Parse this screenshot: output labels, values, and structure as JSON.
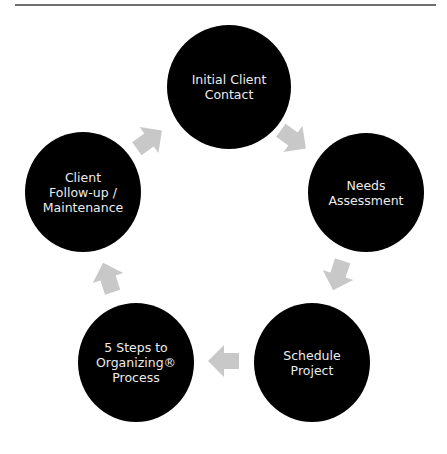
{
  "diagram": {
    "type": "cycle",
    "colors": {
      "node_fill": "#000000",
      "node_text": "#ececec",
      "arrow_fill": "#c8c8c8",
      "rule": "#6e6e6e"
    },
    "nodes": [
      {
        "label": "Initial Client\nContact"
      },
      {
        "label": "Needs\nAssessment"
      },
      {
        "label": "Schedule\nProject"
      },
      {
        "label": "5 Steps to\nOrganizing®\nProcess"
      },
      {
        "label": "Client\nFollow-up /\nMaintenance"
      }
    ],
    "arrows": [
      {
        "from": "Initial Client Contact",
        "to": "Needs Assessment",
        "icon": "arrow-right-icon"
      },
      {
        "from": "Needs Assessment",
        "to": "Schedule Project",
        "icon": "arrow-right-icon"
      },
      {
        "from": "Schedule Project",
        "to": "5 Steps to Organizing® Process",
        "icon": "arrow-right-icon"
      },
      {
        "from": "5 Steps to Organizing® Process",
        "to": "Client Follow-up / Maintenance",
        "icon": "arrow-right-icon"
      },
      {
        "from": "Client Follow-up / Maintenance",
        "to": "Initial Client Contact",
        "icon": "arrow-right-icon"
      }
    ]
  }
}
